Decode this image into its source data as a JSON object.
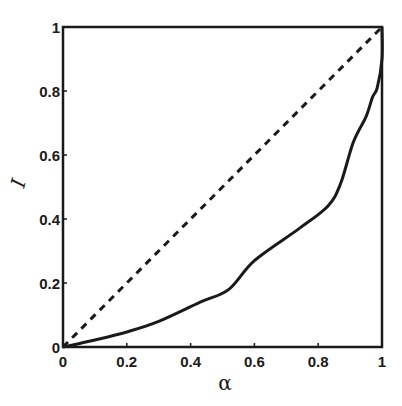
{
  "chart_data": {
    "type": "line",
    "title": "",
    "xlabel": "α",
    "ylabel": "I",
    "xlim": [
      0,
      1
    ],
    "ylim": [
      0,
      1
    ],
    "grid": false,
    "legend": null,
    "x_ticks": [
      "0",
      "0.2",
      "0.4",
      "0.6",
      "0.8",
      "1"
    ],
    "y_ticks": [
      "0",
      "0.2",
      "0.4",
      "0.6",
      "0.8",
      "1"
    ],
    "series": [
      {
        "name": "diagonal",
        "style": "dashed",
        "x": [
          0,
          1
        ],
        "y": [
          0,
          1
        ]
      },
      {
        "name": "curve",
        "style": "solid",
        "x": [
          0,
          0.1,
          0.2,
          0.3,
          0.43,
          0.52,
          0.6,
          0.74,
          0.83,
          0.87,
          0.91,
          0.95,
          0.97,
          0.985,
          1.0,
          1.0
        ],
        "y": [
          0,
          0.022,
          0.047,
          0.08,
          0.14,
          0.18,
          0.27,
          0.37,
          0.44,
          0.51,
          0.64,
          0.72,
          0.78,
          0.81,
          0.9,
          1.0
        ]
      }
    ]
  },
  "colors": {
    "line": "#1a1a1a",
    "background": "#ffffff"
  }
}
